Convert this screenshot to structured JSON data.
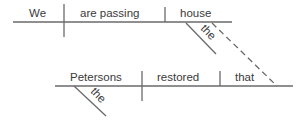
{
  "diagram": {
    "type": "sentence-diagram",
    "main_clause": {
      "subject": "We",
      "verb": "are passing",
      "object": "house",
      "object_modifier": "the"
    },
    "relative_clause": {
      "subject": "Petersons",
      "subject_modifier": "the",
      "verb": "restored",
      "object": "that"
    },
    "connector": "dashed"
  }
}
